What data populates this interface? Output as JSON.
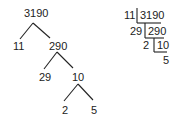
{
  "factor_tree": {
    "root": "3190",
    "level1": {
      "left": "11",
      "right": "290"
    },
    "level2": {
      "left": "29",
      "right": "10"
    },
    "level3": {
      "left": "2",
      "right": "5"
    }
  },
  "division_ladder": {
    "rows": [
      {
        "divisor": "11",
        "dividend": "3190"
      },
      {
        "divisor": "29",
        "dividend": "290"
      },
      {
        "divisor": "2",
        "dividend": "10"
      }
    ],
    "quotient": "5"
  },
  "colors": {
    "ink": "#222222",
    "background": "#ffffff"
  }
}
